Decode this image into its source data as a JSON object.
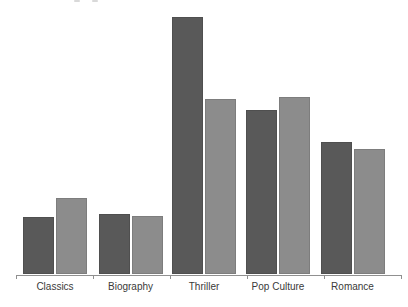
{
  "chart_data": {
    "type": "bar",
    "subtype": "grouped-vertical",
    "title": "",
    "xlabel": "",
    "ylabel": "",
    "categories": [
      "Classics",
      "Biography",
      "Thriller",
      "Pop Culture",
      "Romance"
    ],
    "series": [
      {
        "name": "series-dark",
        "color": "#595959",
        "values": [
          22,
          23.5,
          100,
          64,
          51.5
        ]
      },
      {
        "name": "series-light",
        "color": "#8c8c8c",
        "values": [
          29.5,
          22.5,
          68,
          69,
          48.5
        ]
      }
    ],
    "value_scale": "relative, estimated from bar heights (tallest bar = 100); no y-axis or value labels are shown",
    "ylim": [
      0,
      105
    ],
    "grid": "off",
    "legend": "none",
    "layout": {
      "baseline_y": 274,
      "px_per_unit": 2.57,
      "bar_width": 31,
      "group_centers": [
        55,
        130.5,
        204,
        278,
        352.5
      ],
      "axis": {
        "x0": 16,
        "x1": 401,
        "y": 275,
        "tick_len": 4,
        "color": "#909090"
      },
      "label_top": 281,
      "label_color": "#3a3a3a"
    }
  }
}
